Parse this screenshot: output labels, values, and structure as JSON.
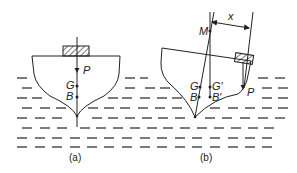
{
  "figure": {
    "panel_a": {
      "caption": "(a)",
      "labels": {
        "load": "P",
        "centre_of_gravity": "G",
        "centre_of_buoyancy": "B"
      }
    },
    "panel_b": {
      "caption": "(b)",
      "labels": {
        "metacentre": "M",
        "distance": "x",
        "centre_of_gravity": "G",
        "shifted_centre_of_gravity": "G′",
        "centre_of_buoyancy": "B",
        "shifted_centre_of_buoyancy": "B′",
        "load": "P"
      }
    }
  },
  "colors": {
    "line": "#222222",
    "water": "#333333",
    "background": "#ffffff"
  }
}
